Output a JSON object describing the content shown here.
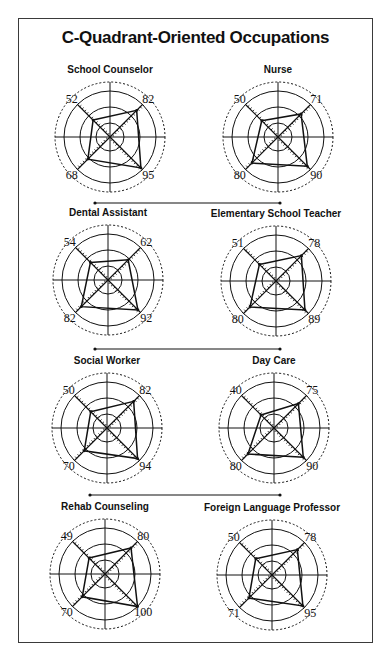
{
  "title": "C-Quadrant-Oriented Occupations",
  "chart_data": {
    "type": "radar",
    "title": "C-Quadrant-Oriented Occupations",
    "axes": [
      "top-left",
      "top-right",
      "bottom-right",
      "bottom-left"
    ],
    "range": [
      0,
      100
    ],
    "grid": true,
    "charts": [
      {
        "name": "School Counselor",
        "values": [
          52,
          82,
          95,
          68
        ]
      },
      {
        "name": "Nurse",
        "values": [
          50,
          71,
          90,
          80
        ]
      },
      {
        "name": "Dental Assistant",
        "values": [
          54,
          62,
          92,
          82
        ]
      },
      {
        "name": "Elementary School Teacher",
        "values": [
          51,
          78,
          89,
          80
        ]
      },
      {
        "name": "Social Worker",
        "values": [
          50,
          82,
          94,
          70
        ]
      },
      {
        "name": "Day Care",
        "values": [
          40,
          75,
          90,
          80
        ]
      },
      {
        "name": "Rehab Counseling",
        "values": [
          49,
          80,
          100,
          70
        ]
      },
      {
        "name": "Foreign Language Professor",
        "values": [
          50,
          78,
          95,
          71
        ]
      }
    ]
  },
  "colors": {
    "ink": "#111111",
    "frame": "#3a3a3a"
  }
}
